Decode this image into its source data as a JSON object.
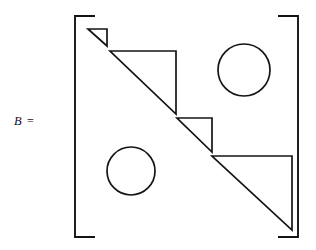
{
  "figure": {
    "label": {
      "variable": "B",
      "equals": "="
    },
    "stroke_color": "#141414",
    "background_color": "#ffffff",
    "bracket": {
      "name": "square-bracket-pair",
      "left_x": 75,
      "right_x": 298,
      "top_y": 16,
      "bottom_y": 237,
      "serif_length": 20
    },
    "blocks": [
      {
        "name": "triangle-block-1",
        "kind": "right-triangle",
        "position": "diagonal-1",
        "points": "88,29 107,29 107,46",
        "size": "small"
      },
      {
        "name": "triangle-block-2",
        "kind": "right-triangle",
        "position": "diagonal-2",
        "points": "110,51 176,51 176,114",
        "size": "large"
      },
      {
        "name": "triangle-block-3",
        "kind": "right-triangle",
        "position": "diagonal-3",
        "points": "177,118 212,118 212,152",
        "size": "small"
      },
      {
        "name": "triangle-block-4",
        "kind": "right-triangle",
        "position": "diagonal-4",
        "points": "212,156 292,156 292,230",
        "size": "large"
      },
      {
        "name": "circle-block-upper-right",
        "kind": "circle",
        "position": "upper-right",
        "cx": 244,
        "cy": 70,
        "r": 26
      },
      {
        "name": "circle-block-lower-left",
        "kind": "circle",
        "position": "lower-left",
        "cx": 131,
        "cy": 171,
        "r": 24
      }
    ]
  }
}
